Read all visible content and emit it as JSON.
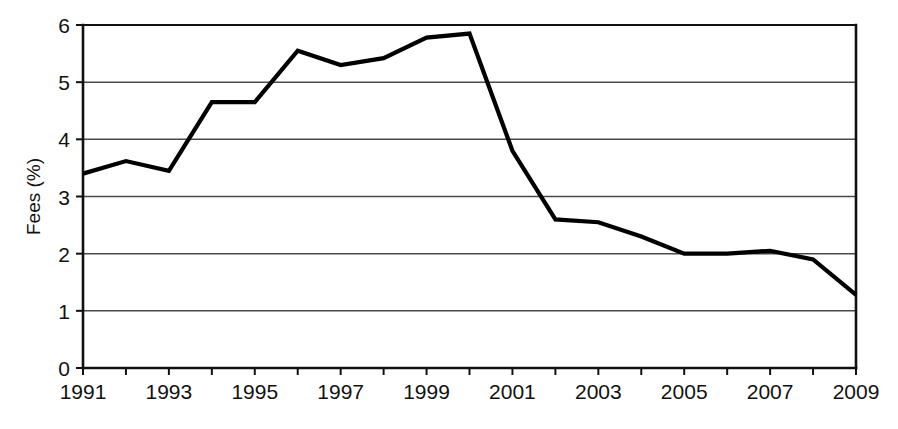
{
  "chart_data": {
    "type": "line",
    "title": "",
    "xlabel": "",
    "ylabel": "Fees (%)",
    "xlim": [
      1991,
      2009
    ],
    "ylim": [
      0,
      6
    ],
    "grid": true,
    "legend": "none",
    "x": [
      1991,
      1992,
      1993,
      1994,
      1995,
      1996,
      1997,
      1998,
      1999,
      2000,
      2001,
      2002,
      2003,
      2004,
      2005,
      2006,
      2007,
      2008,
      2009
    ],
    "values": [
      3.4,
      3.62,
      3.45,
      4.65,
      4.65,
      5.55,
      5.3,
      5.42,
      5.78,
      5.85,
      3.8,
      2.6,
      2.55,
      2.3,
      2.0,
      2.0,
      2.05,
      1.9,
      1.28
    ],
    "series": [
      {
        "name": "Fees",
        "color": "#000000",
        "values": [
          3.4,
          3.62,
          3.45,
          4.65,
          4.65,
          5.55,
          5.3,
          5.42,
          5.78,
          5.85,
          3.8,
          2.6,
          2.55,
          2.3,
          2.0,
          2.0,
          2.05,
          1.9,
          1.28
        ]
      }
    ],
    "y_ticks": [
      0,
      1,
      2,
      3,
      4,
      5,
      6
    ],
    "y_tick_labels": [
      "0",
      "1",
      "2",
      "3",
      "4",
      "5",
      "6"
    ],
    "x_ticks": [
      1991,
      1992,
      1993,
      1994,
      1995,
      1996,
      1997,
      1998,
      1999,
      2000,
      2001,
      2002,
      2003,
      2004,
      2005,
      2006,
      2007,
      2008,
      2009
    ],
    "x_tick_labels_shown": [
      "1991",
      "1993",
      "1995",
      "1997",
      "1999",
      "2001",
      "2003",
      "2005",
      "2007",
      "2009"
    ]
  },
  "axes": {
    "y_axis_title": "Fees (%)"
  }
}
